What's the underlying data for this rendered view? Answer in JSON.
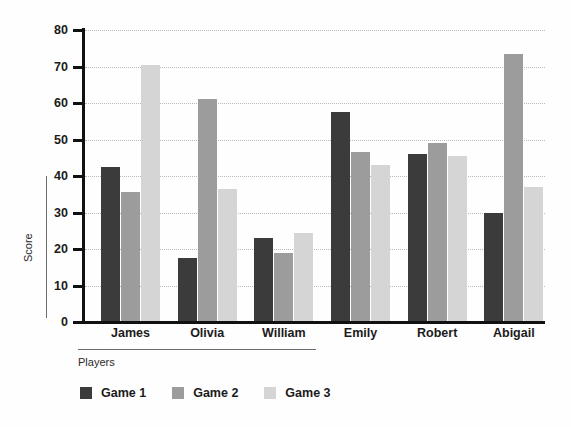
{
  "chart_data": {
    "type": "bar",
    "title": "",
    "subtitle": "",
    "xlabel": "Players",
    "ylabel": "Score",
    "categories": [
      "James",
      "Olivia",
      "William",
      "Emily",
      "Robert",
      "Abigail"
    ],
    "series": [
      {
        "name": "Game 1",
        "color": "#3b3b3b",
        "values": [
          42.5,
          17.5,
          23.0,
          57.5,
          46.0,
          29.8
        ]
      },
      {
        "name": "Game 2",
        "color": "#9c9c9c",
        "values": [
          35.5,
          61.0,
          19.0,
          46.5,
          49.0,
          73.5
        ]
      },
      {
        "name": "Game 3",
        "color": "#d5d5d5",
        "values": [
          70.5,
          36.5,
          24.5,
          43.0,
          45.5,
          37.0
        ]
      }
    ],
    "ylim": [
      0,
      80
    ],
    "ytick_labels": [
      "80",
      "70",
      "60",
      "50",
      "40",
      "30",
      "20",
      "10",
      "0"
    ],
    "yticks": [
      80,
      70,
      60,
      50,
      40,
      30,
      20,
      10,
      0
    ],
    "grid": "horizontal-dotted",
    "legend_position": "bottom-left",
    "bar_orientation": "vertical",
    "grouped": true
  },
  "legend": {
    "items": [
      {
        "label": "Game 1",
        "color": "#3b3b3b"
      },
      {
        "label": "Game 2",
        "color": "#9c9c9c"
      },
      {
        "label": "Game 3",
        "color": "#d5d5d5"
      }
    ]
  },
  "colors": {
    "background": "#fefefe",
    "axis": "#111111",
    "gridline": "#b9b9b9",
    "text": "#1b1b1b",
    "axis_title": "#2a2a2a"
  }
}
